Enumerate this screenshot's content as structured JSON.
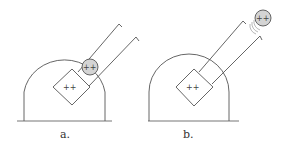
{
  "figure": {
    "panels": [
      {
        "id": "a",
        "label": "a.",
        "emitter_charge": "++",
        "particle_charge": "++",
        "particle_state": "at aperture (inside tube mouth)"
      },
      {
        "id": "b",
        "label": "b.",
        "emitter_charge": "++",
        "particle_charge": "++",
        "particle_state": "ejected beyond tube with emission waves"
      }
    ],
    "colors": {
      "line": "#555555",
      "particle_fill": "#d4d4d4",
      "background": "#ffffff"
    }
  }
}
